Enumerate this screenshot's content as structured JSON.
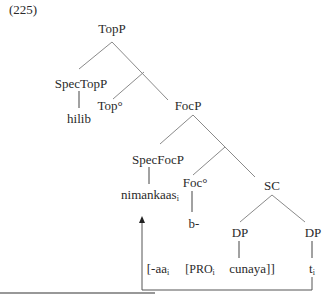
{
  "example_number": "(225)",
  "nodes": {
    "topp": "TopP",
    "spec_topp": "SpecTopP",
    "hilib": "hilib",
    "top_head": "Top°",
    "focp": "FocP",
    "spec_focp": "SpecFocP",
    "nimankaas": "nimankaas",
    "nimankaas_index": "i",
    "foc_head": "Foc°",
    "b": "b-",
    "sc": "SC",
    "dp_left": "DP",
    "dp_right": "DP"
  },
  "terminal_string": {
    "aa": "[-aa",
    "aa_index": "i",
    "pro": "[PRO",
    "pro_index": "i",
    "cunaya": "cunaya]]",
    "trace": "t",
    "trace_index": "i"
  },
  "colors": {
    "line": "#8a8a8a",
    "arrow": "#555555",
    "text": "#2a2a2a"
  }
}
